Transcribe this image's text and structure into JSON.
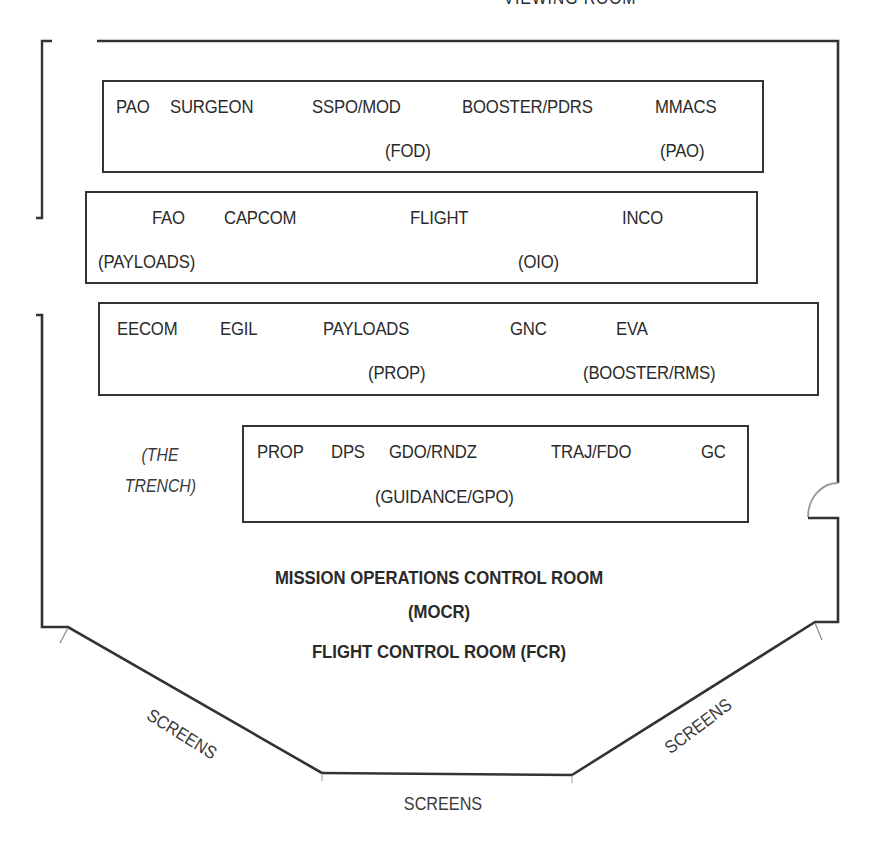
{
  "diagram": {
    "top_label": "VIEWING ROOM",
    "room_title_line1": "MISSION OPERATIONS CONTROL ROOM",
    "room_title_line2": "(MOCR)",
    "room_subtitle": "FLIGHT CONTROL ROOM (FCR)",
    "trench_label_line1": "(THE",
    "trench_label_line2": "TRENCH)",
    "screens": {
      "left": "SCREENS",
      "right": "SCREENS",
      "bottom": "SCREENS"
    },
    "consoles": [
      {
        "row": 1,
        "positions": [
          {
            "label": "PAO",
            "alt": ""
          },
          {
            "label": "SURGEON",
            "alt": ""
          },
          {
            "label": "SSPO/MOD",
            "alt": "(FOD)"
          },
          {
            "label": "BOOSTER/PDRS",
            "alt": ""
          },
          {
            "label": "MMACS",
            "alt": "(PAO)"
          }
        ]
      },
      {
        "row": 2,
        "positions": [
          {
            "label": "FAO",
            "alt": "(PAYLOADS)"
          },
          {
            "label": "CAPCOM",
            "alt": ""
          },
          {
            "label": "FLIGHT",
            "alt": ""
          },
          {
            "label": "",
            "alt": "(OIO)"
          },
          {
            "label": "INCO",
            "alt": ""
          }
        ]
      },
      {
        "row": 3,
        "positions": [
          {
            "label": "EECOM",
            "alt": ""
          },
          {
            "label": "EGIL",
            "alt": ""
          },
          {
            "label": "PAYLOADS",
            "alt": "(PROP)"
          },
          {
            "label": "GNC",
            "alt": ""
          },
          {
            "label": "EVA",
            "alt": "(BOOSTER/RMS)"
          }
        ]
      },
      {
        "row": 4,
        "positions": [
          {
            "label": "PROP",
            "alt": ""
          },
          {
            "label": "DPS",
            "alt": ""
          },
          {
            "label": "GDO/RNDZ",
            "alt": "(GUIDANCE/GPO)"
          },
          {
            "label": "TRAJ/FDO",
            "alt": ""
          },
          {
            "label": "GC",
            "alt": ""
          }
        ]
      }
    ],
    "colors": {
      "wall": "#333333",
      "text": "#2a2a2a",
      "thin_line": "#888888"
    }
  }
}
